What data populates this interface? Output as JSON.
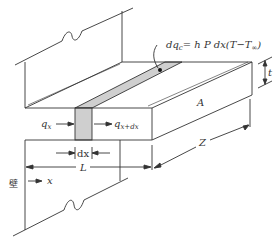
{
  "diagram": {
    "type": "fin-heat-transfer-schematic",
    "equation": {
      "lhs": "dq",
      "lhs_sub": "c",
      "rhs": "= h P dx(T−T",
      "rhs_sub": "∞",
      "close": ")"
    },
    "labels": {
      "q_in": "q",
      "q_in_sub": "x",
      "q_out": "q",
      "q_out_sub": "x+dx",
      "dx": "dx",
      "L": "L",
      "Z": "Z",
      "A": "A",
      "t": "t",
      "x": "x",
      "wall": "壁"
    },
    "colors": {
      "line": "#333333",
      "strip_fill": "#cfcfcf",
      "background": "#ffffff"
    }
  }
}
